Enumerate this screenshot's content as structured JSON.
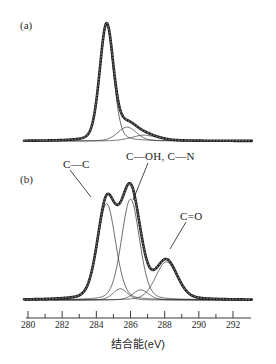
{
  "figure": {
    "type": "xps-spectra-figure",
    "panels": [
      {
        "tag": "(a)"
      },
      {
        "tag": "(b)"
      }
    ],
    "axis": {
      "title": "结合能(eV)",
      "tick_labels": [
        "280",
        "282",
        "284",
        "286",
        "288",
        "290",
        "292"
      ]
    },
    "labels": {
      "c_c": "C—C",
      "c_oh_c_n": "C—OH, C—N",
      "c_o": "C=O"
    },
    "colors": {
      "envelope": "#1c1c1c",
      "component": "#2b2b2b",
      "axis": "#3a3a3a",
      "background": "#ffffff"
    }
  },
  "chart_data": [
    {
      "type": "line",
      "title": "(a)",
      "xlabel": "结合能(eV)",
      "ylabel": "",
      "xlim": [
        279.5,
        293.3
      ],
      "ylim": [
        0,
        1.05
      ],
      "xticks": [
        280,
        282,
        284,
        286,
        288,
        290,
        292
      ],
      "grid": false,
      "legend": null,
      "axis_direction": "increasing-left-to-right",
      "series": [
        {
          "name": "envelope",
          "kind": "fitted-envelope",
          "peaks": [
            {
              "center": 284.6,
              "amplitude": 1.0,
              "fwhm": 0.95
            },
            {
              "center": 285.8,
              "amplitude": 0.12,
              "fwhm": 1.3
            },
            {
              "center": 286.8,
              "amplitude": 0.05,
              "fwhm": 1.8
            }
          ]
        },
        {
          "name": "component-1",
          "kind": "component",
          "center": 284.6,
          "amplitude": 1.0,
          "fwhm": 0.95
        },
        {
          "name": "component-2",
          "kind": "component",
          "center": 285.8,
          "amplitude": 0.12,
          "fwhm": 1.3
        },
        {
          "name": "component-3",
          "kind": "component",
          "center": 286.8,
          "amplitude": 0.05,
          "fwhm": 1.8
        }
      ]
    },
    {
      "type": "line",
      "title": "(b)",
      "xlabel": "结合能(eV)",
      "ylabel": "",
      "xlim": [
        279.5,
        293.3
      ],
      "ylim": [
        0,
        1.05
      ],
      "xticks": [
        280,
        282,
        284,
        286,
        288,
        290,
        292
      ],
      "grid": false,
      "legend": null,
      "annotations": [
        "C—C",
        "C—OH, C—N",
        "C=O"
      ],
      "series": [
        {
          "name": "envelope",
          "kind": "fitted-envelope",
          "peaks": [
            {
              "center": 284.6,
              "amplitude": 0.86,
              "fwhm": 1.25,
              "assignment": "C—C"
            },
            {
              "center": 285.4,
              "amplitude": 0.1,
              "fwhm": 1.0
            },
            {
              "center": 286.0,
              "amplitude": 0.9,
              "fwhm": 1.25,
              "assignment": "C—OH, C—N"
            },
            {
              "center": 286.6,
              "amplitude": 0.09,
              "fwhm": 1.1
            },
            {
              "center": 288.1,
              "amplitude": 0.34,
              "fwhm": 1.5,
              "assignment": "C=O"
            }
          ]
        },
        {
          "name": "component-c-c",
          "kind": "component",
          "center": 284.6,
          "amplitude": 0.86,
          "fwhm": 1.25
        },
        {
          "name": "component-small-1",
          "kind": "component",
          "center": 285.4,
          "amplitude": 0.1,
          "fwhm": 1.0
        },
        {
          "name": "component-c-oh-c-n",
          "kind": "component",
          "center": 286.0,
          "amplitude": 0.9,
          "fwhm": 1.25
        },
        {
          "name": "component-small-2",
          "kind": "component",
          "center": 286.6,
          "amplitude": 0.09,
          "fwhm": 1.1
        },
        {
          "name": "component-c-o",
          "kind": "component",
          "center": 288.1,
          "amplitude": 0.34,
          "fwhm": 1.5
        }
      ]
    }
  ]
}
